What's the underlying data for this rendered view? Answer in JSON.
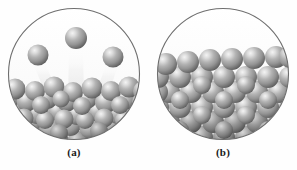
{
  "figure": {
    "background_color": "#fefefe",
    "panel_count": 2,
    "circle_outline_color": "#6e6e6e",
    "circle_fill_color": "#fdfdfd",
    "sphere_colors": {
      "highlight": "#f2f2f2",
      "mid": "#a6a6a6",
      "body": "#8e8e8e",
      "shadow": "#5c5c5c",
      "deep_shadow": "#4a4a4a"
    },
    "trail_color": "#e8e8e8"
  },
  "panels": [
    {
      "id": "a",
      "caption": "(a)",
      "state_name": "liquid-evaporating",
      "description": "Disordered close-packed spheres filling the lower portion of the circle, with three spheres escaping upward above the surface, each leaving a light vertical motion trail.",
      "escaping_spheres": [
        {
          "cx": 31,
          "cy": 48,
          "r": 10.5
        },
        {
          "cx": 69,
          "cy": 31,
          "r": 11.0
        },
        {
          "cx": 106,
          "cy": 50,
          "r": 10.5
        }
      ],
      "trails": [
        {
          "x1": 31,
          "y1": 58,
          "x2": 44,
          "y2": 84,
          "width": 13
        },
        {
          "x1": 69,
          "y1": 42,
          "x2": 69,
          "y2": 86,
          "width": 14
        },
        {
          "x1": 106,
          "y1": 60,
          "x2": 96,
          "y2": 84,
          "width": 13
        }
      ],
      "packing": "disordered",
      "surface_level_y": 80,
      "sphere_radius": 10.5,
      "sphere_count_visible": 48
    },
    {
      "id": "b",
      "caption": "(b)",
      "state_name": "crystalline-solid",
      "description": "Regular ordered lattice of close-packed spheres filling the lower two-thirds of the circle with a flat, even top surface.",
      "escaping_spheres": [],
      "trails": [],
      "packing": "ordered-lattice",
      "surface_level_y": 52,
      "sphere_radius": 11.0,
      "sphere_count_visible": 56
    }
  ]
}
